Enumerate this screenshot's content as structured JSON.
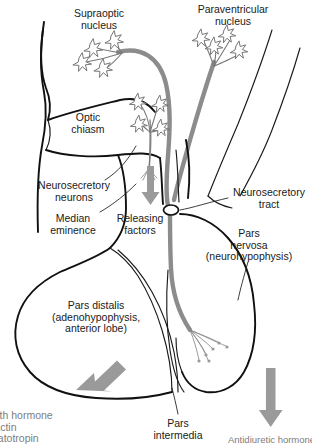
{
  "figure": {
    "type": "anatomical-diagram",
    "width": 312,
    "height": 444,
    "background_color": "#ffffff",
    "line_color": "#111111",
    "tract_color": "#8c8c8c",
    "arrow_color": "#9a9a9a"
  },
  "labels": {
    "supraoptic_nucleus": "Supraoptic\nnucleus",
    "paraventricular_nucleus": "Paraventricular\nnucleus",
    "optic_chiasm": "Optic\nchiasm",
    "neurosecretory_neurons": "Neurosecretory\nneurons",
    "median_eminence": "Median\neminence",
    "releasing_factors": "Releasing\nfactors",
    "neurosecretory_tract": "Neurosecretory\ntract",
    "pars_nervosa": "Pars\nnervosa\n(neurohypophysis)",
    "pars_distalis": "Pars distalis\n(adenohypophysis,\nanterior lobe)",
    "pars_intermedia": "Pars\nintermedia",
    "anterior_hormones_clipped": "wth hormone\nlactin\nnatotropin",
    "posterior_hormone_clipped": "Antidiuretic hormone"
  },
  "structures": [
    {
      "name": "supraoptic-nucleus",
      "region": "hypothalamus"
    },
    {
      "name": "paraventricular-nucleus",
      "region": "hypothalamus"
    },
    {
      "name": "optic-chiasm",
      "region": "hypothalamus"
    },
    {
      "name": "median-eminence",
      "region": "hypothalamus"
    },
    {
      "name": "neurosecretory-tract",
      "region": "infundibulum"
    },
    {
      "name": "pars-nervosa",
      "region": "posterior-pituitary"
    },
    {
      "name": "pars-distalis",
      "region": "anterior-pituitary"
    },
    {
      "name": "pars-intermedia",
      "region": "pituitary"
    }
  ]
}
